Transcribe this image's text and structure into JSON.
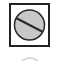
{
  "toolbar": {
    "items": [
      {
        "icon": "prohibited-icon",
        "label": "",
        "colors": {
          "fill": "#c8c8c8",
          "stroke": "#2a2a2a",
          "border": "#222222"
        }
      },
      {
        "icon": "partial-arc-icon",
        "label": ""
      }
    ]
  }
}
